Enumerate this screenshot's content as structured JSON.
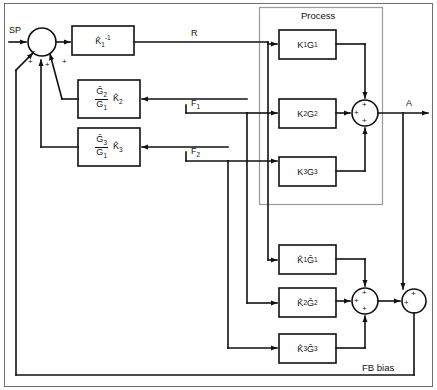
{
  "diagram": {
    "process_group_label": "Process",
    "fb_bias_label": "FB bias"
  },
  "signals": {
    "sp": "SP",
    "r": "R",
    "a": "A",
    "f1": "F",
    "f1_sub": "1",
    "f2": "F",
    "f2_sub": "2"
  },
  "controller_blocks": [
    {
      "id": "k1inv",
      "base": "K",
      "hat": true,
      "sub": "1",
      "sup": "-1"
    },
    {
      "id": "g2g1k2",
      "num_base": "G",
      "num_sub": "2",
      "den_base": "G",
      "den_sub": "1",
      "gain_base": "K",
      "gain_sub": "2"
    },
    {
      "id": "g3g1k3",
      "num_base": "G",
      "num_sub": "3",
      "den_base": "G",
      "den_sub": "1",
      "gain_base": "K",
      "gain_sub": "3"
    }
  ],
  "process_blocks": [
    {
      "id": "k1g1",
      "k": "K",
      "ksub": "1",
      "g": "G",
      "gsub": "1"
    },
    {
      "id": "k2g2",
      "k": "K",
      "ksub": "2",
      "g": "G",
      "gsub": "2"
    },
    {
      "id": "k3g3",
      "k": "K",
      "ksub": "3",
      "g": "G",
      "gsub": "3"
    }
  ],
  "model_blocks": [
    {
      "id": "m1",
      "k": "K",
      "ksub": "1",
      "g": "G",
      "gsub": "1"
    },
    {
      "id": "m2",
      "k": "K",
      "ksub": "2",
      "g": "G",
      "gsub": "2"
    },
    {
      "id": "m3",
      "k": "K",
      "ksub": "3",
      "g": "G",
      "gsub": "3"
    }
  ],
  "junctions": {
    "input_sum": {
      "signs": [
        "-",
        "+",
        "+",
        "+"
      ]
    },
    "process_sum": {
      "signs": [
        "+",
        "+",
        "+"
      ]
    },
    "model_sum": {
      "signs": [
        "+",
        "+",
        "+"
      ]
    },
    "output_sum": {
      "signs": [
        "+",
        "+"
      ]
    }
  },
  "colors": {
    "line": "#111111",
    "group_border": "#9a9a9a",
    "frame": "#6f6f6f",
    "background": "#ffffff"
  }
}
